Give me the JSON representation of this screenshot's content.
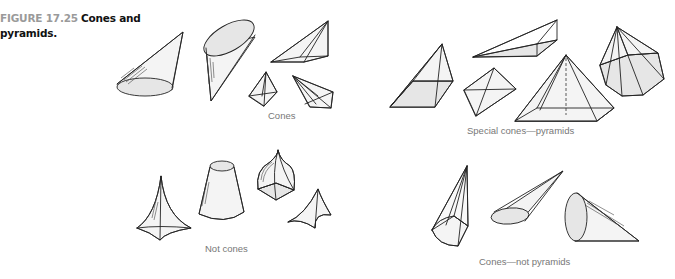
{
  "caption": {
    "figure_label": "FIGURE 17.25",
    "title": "Cones and pyramids."
  },
  "groups": [
    {
      "id": "cones",
      "label": "Cones",
      "shape_count": 5
    },
    {
      "id": "special-cones-pyramids",
      "label": "Special cones—pyramids",
      "shape_count": 5
    },
    {
      "id": "not-cones",
      "label": "Not cones",
      "shape_count": 4
    },
    {
      "id": "cones-not-pyramids",
      "label": "Cones—not pyramids",
      "shape_count": 3
    }
  ],
  "colors": {
    "figure_label": "#9a9a9a",
    "title": "#111111",
    "group_label": "#777777",
    "shape_fill": "#e6e6e6",
    "shape_stroke": "#222222"
  }
}
